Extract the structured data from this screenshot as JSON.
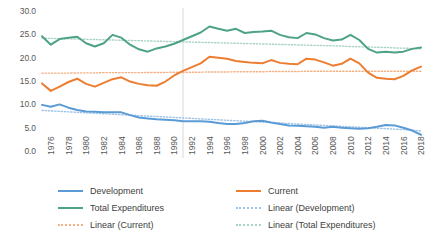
{
  "chart_data": {
    "type": "line",
    "title": "",
    "xlabel": "",
    "ylabel": "",
    "ylim": [
      0.0,
      30.0
    ],
    "xlim": [
      1976,
      2019
    ],
    "grid": false,
    "legend_position": "bottom",
    "ytick_labels": [
      "30.0",
      "25.0",
      "20.0",
      "15.0",
      "10.0",
      "5.0",
      "0.0"
    ],
    "ytick_values": [
      30.0,
      25.0,
      20.0,
      15.0,
      10.0,
      5.0,
      0.0
    ],
    "xtick_labels": [
      "1976",
      "1978",
      "1980",
      "1982",
      "1984",
      "1986",
      "1988",
      "1990",
      "1992",
      "1994",
      "1996",
      "1998",
      "2000",
      "2002",
      "2004",
      "2006",
      "2008",
      "2010",
      "2012",
      "2014",
      "2016",
      "2018"
    ],
    "x": [
      1976,
      1977,
      1978,
      1979,
      1980,
      1981,
      1982,
      1983,
      1984,
      1985,
      1986,
      1987,
      1988,
      1989,
      1990,
      1991,
      1992,
      1993,
      1994,
      1995,
      1996,
      1997,
      1998,
      1999,
      2000,
      2001,
      2002,
      2003,
      2004,
      2005,
      2006,
      2007,
      2008,
      2009,
      2010,
      2011,
      2012,
      2013,
      2014,
      2015,
      2016,
      2017,
      2018,
      2019
    ],
    "annotations": [
      {
        "type": "vertical-line",
        "x": 1992,
        "color": "#d9d9d9"
      }
    ],
    "colors": {
      "development": "#5B9BD5",
      "current": "#ED7D31",
      "total_expenditures": "#4EA287",
      "linear_development": "#9DC3E6",
      "linear_current": "#F4B183",
      "linear_total_expenditures": "#A9D3C4"
    },
    "series": [
      {
        "name": "Development",
        "key": "development",
        "color": "#5B9BD5",
        "style": "solid",
        "values": [
          10.1,
          9.7,
          10.2,
          9.5,
          9.0,
          8.7,
          8.6,
          8.5,
          8.5,
          8.5,
          7.9,
          7.4,
          7.2,
          7.0,
          6.9,
          6.8,
          6.6,
          6.6,
          6.6,
          6.5,
          6.2,
          6.0,
          6.0,
          6.2,
          6.6,
          6.7,
          6.3,
          6.0,
          5.7,
          5.6,
          5.5,
          5.4,
          5.2,
          5.4,
          5.2,
          5.1,
          5.0,
          5.1,
          5.4,
          5.8,
          5.7,
          5.2,
          4.6,
          3.7
        ]
      },
      {
        "name": "Current",
        "key": "current",
        "color": "#ED7D31",
        "style": "solid",
        "values": [
          14.7,
          13.1,
          14.0,
          15.0,
          15.7,
          14.6,
          14.0,
          14.8,
          15.6,
          16.0,
          15.1,
          14.6,
          14.3,
          14.2,
          15.1,
          16.4,
          17.4,
          18.2,
          19.0,
          20.4,
          20.2,
          20.0,
          19.5,
          19.3,
          19.1,
          19.0,
          19.7,
          19.1,
          18.9,
          18.8,
          20.0,
          19.8,
          19.2,
          18.5,
          18.9,
          20.0,
          19.0,
          17.0,
          15.9,
          15.7,
          15.6,
          16.3,
          17.5,
          18.3
        ]
      },
      {
        "name": "Total Expenditures",
        "key": "total_expenditures",
        "color": "#4EA287",
        "style": "solid",
        "values": [
          24.8,
          23.0,
          24.2,
          24.5,
          24.7,
          23.3,
          22.6,
          23.3,
          25.1,
          24.5,
          23.0,
          22.0,
          21.5,
          22.2,
          22.6,
          23.2,
          24.0,
          24.8,
          25.6,
          26.9,
          26.4,
          26.0,
          26.4,
          25.5,
          25.7,
          25.8,
          26.0,
          25.1,
          24.6,
          24.4,
          25.5,
          25.2,
          24.4,
          23.9,
          24.1,
          25.1,
          24.0,
          22.1,
          21.3,
          21.5,
          21.3,
          21.5,
          22.1,
          22.4
        ]
      },
      {
        "name": "Linear (Development)",
        "key": "linear_development",
        "color": "#9DC3E6",
        "style": "dotted",
        "trend_from": 8.9,
        "trend_to": 4.5,
        "values": [
          8.9,
          8.8,
          8.7,
          8.6,
          8.5,
          8.4,
          8.3,
          8.2,
          8.1,
          8.0,
          7.9,
          7.8,
          7.7,
          7.6,
          7.5,
          7.4,
          7.3,
          7.2,
          7.1,
          7.0,
          6.9,
          6.8,
          6.7,
          6.6,
          6.5,
          6.4,
          6.3,
          6.2,
          6.1,
          6.0,
          5.9,
          5.8,
          5.7,
          5.6,
          5.5,
          5.4,
          5.3,
          5.2,
          5.1,
          5.0,
          4.9,
          4.8,
          4.7,
          4.5
        ]
      },
      {
        "name": "Linear (Current)",
        "key": "linear_current",
        "color": "#F4B183",
        "style": "dotted",
        "trend_from": 16.9,
        "trend_to": 17.3,
        "values": [
          16.9,
          16.9,
          16.9,
          16.9,
          16.95,
          16.95,
          16.95,
          17.0,
          17.0,
          17.0,
          17.0,
          17.0,
          17.05,
          17.05,
          17.05,
          17.1,
          17.1,
          17.1,
          17.1,
          17.15,
          17.15,
          17.15,
          17.2,
          17.2,
          17.2,
          17.2,
          17.25,
          17.25,
          17.25,
          17.25,
          17.3,
          17.3,
          17.3,
          17.3,
          17.3,
          17.3,
          17.3,
          17.3,
          17.3,
          17.3,
          17.3,
          17.3,
          17.3,
          17.3
        ]
      },
      {
        "name": "Linear (Total Expenditures)",
        "key": "linear_total_expenditures",
        "color": "#A9D3C4",
        "style": "dotted",
        "trend_from": 24.4,
        "trend_to": 22.1,
        "values": [
          24.4,
          24.35,
          24.3,
          24.25,
          24.2,
          24.15,
          24.1,
          24.05,
          24.0,
          23.95,
          23.9,
          23.85,
          23.8,
          23.75,
          23.7,
          23.65,
          23.6,
          23.55,
          23.5,
          23.45,
          23.4,
          23.35,
          23.3,
          23.25,
          23.2,
          23.15,
          23.1,
          23.05,
          23.0,
          22.95,
          22.9,
          22.85,
          22.8,
          22.75,
          22.7,
          22.6,
          22.55,
          22.5,
          22.45,
          22.4,
          22.3,
          22.25,
          22.2,
          22.1
        ]
      }
    ],
    "legend_entries": [
      {
        "label": "Development",
        "color": "#5B9BD5",
        "style": "solid",
        "col": 0,
        "row": 0
      },
      {
        "label": "Current",
        "color": "#ED7D31",
        "style": "solid",
        "col": 1,
        "row": 0
      },
      {
        "label": "Total Expenditures",
        "color": "#4EA287",
        "style": "solid",
        "col": 0,
        "row": 1
      },
      {
        "label": "Linear (Development)",
        "color": "#9DC3E6",
        "style": "dotted",
        "col": 1,
        "row": 1
      },
      {
        "label": "Linear (Current)",
        "color": "#F4B183",
        "style": "dotted",
        "col": 0,
        "row": 2
      },
      {
        "label": "Linear (Total Expenditures)",
        "color": "#A9D3C4",
        "style": "dotted",
        "col": 1,
        "row": 2
      }
    ]
  }
}
